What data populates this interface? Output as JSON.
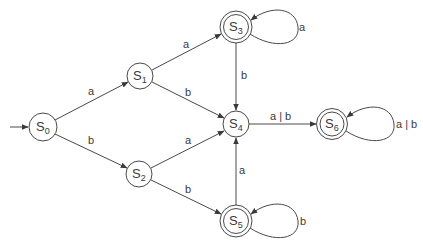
{
  "diagram": {
    "type": "finite-automaton",
    "colors": {
      "stroke": "#4a4a4a",
      "text": "#3a3a3a",
      "background": "#ffffff"
    },
    "start_state": "S0",
    "states": [
      {
        "id": "S0",
        "base": "S",
        "sub": "0",
        "x": 43,
        "y": 127,
        "accepting": false
      },
      {
        "id": "S1",
        "base": "S",
        "sub": "1",
        "x": 140,
        "y": 76,
        "accepting": false
      },
      {
        "id": "S2",
        "base": "S",
        "sub": "2",
        "x": 139,
        "y": 174,
        "accepting": false
      },
      {
        "id": "S3",
        "base": "S",
        "sub": "3",
        "x": 236,
        "y": 27,
        "accepting": true
      },
      {
        "id": "S4",
        "base": "S",
        "sub": "4",
        "x": 236,
        "y": 124,
        "accepting": false
      },
      {
        "id": "S5",
        "base": "S",
        "sub": "5",
        "x": 236,
        "y": 221,
        "accepting": true
      },
      {
        "id": "S6",
        "base": "S",
        "sub": "6",
        "x": 332,
        "y": 124,
        "accepting": true
      }
    ],
    "transitions": [
      {
        "from": "S0",
        "to": "S1",
        "label": "a",
        "lx": 91,
        "ly": 95
      },
      {
        "from": "S0",
        "to": "S2",
        "label": "b",
        "lx": 91,
        "ly": 144
      },
      {
        "from": "S1",
        "to": "S3",
        "label": "a",
        "lx": 186,
        "ly": 48
      },
      {
        "from": "S1",
        "to": "S4",
        "label": "b",
        "lx": 188,
        "ly": 96
      },
      {
        "from": "S2",
        "to": "S4",
        "label": "a",
        "lx": 188,
        "ly": 144
      },
      {
        "from": "S2",
        "to": "S5",
        "label": "b",
        "lx": 188,
        "ly": 193
      },
      {
        "from": "S3",
        "to": "S4",
        "label": "b",
        "lx": 244,
        "ly": 79
      },
      {
        "from": "S5",
        "to": "S4",
        "label": "a",
        "lx": 242,
        "ly": 174
      },
      {
        "from": "S4",
        "to": "S6",
        "label": "a | b",
        "lx": 284,
        "ly": 120
      },
      {
        "from": "S3",
        "to": "S3",
        "label": "a",
        "lx": 302,
        "ly": 31
      },
      {
        "from": "S5",
        "to": "S5",
        "label": "b",
        "lx": 303,
        "ly": 225
      },
      {
        "from": "S6",
        "to": "S6",
        "label": "a | b",
        "lx": 397,
        "ly": 128
      }
    ]
  }
}
